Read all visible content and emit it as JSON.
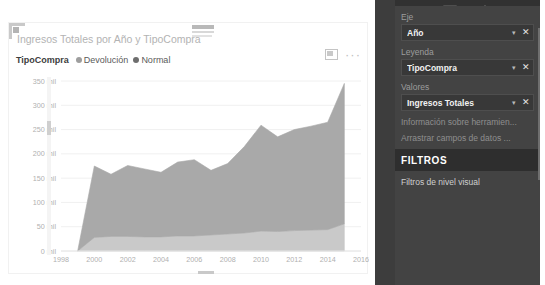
{
  "visual": {
    "title": "Ingresos Totales por Año y TipoCompra",
    "focus_icon": "focus-mode-icon",
    "more_icon": "···"
  },
  "chart_data": {
    "type": "area",
    "title": "Ingresos Totales por Año y TipoCompra",
    "xlabel": "Año",
    "ylabel": "Ingresos Totales",
    "stacked": true,
    "grid": true,
    "legend_position": "top-left",
    "legend_title": "TipoCompra",
    "xlim": [
      1998,
      2016
    ],
    "ylim": [
      0,
      350
    ],
    "y_tick_labels": [
      "350 mil",
      "300 mil",
      "250 mil",
      "200 mil",
      "150 mil",
      "100 mil",
      "50 mil",
      "0 mil"
    ],
    "y_ticks": [
      350,
      300,
      250,
      200,
      150,
      100,
      50,
      0
    ],
    "x_tick_labels": [
      "1998",
      "2000",
      "2002",
      "2004",
      "2006",
      "2008",
      "2010",
      "2012",
      "2014",
      "2016"
    ],
    "x_ticks": [
      1998,
      2000,
      2002,
      2004,
      2006,
      2008,
      2010,
      2012,
      2014,
      2016
    ],
    "x": [
      1999,
      2000,
      2001,
      2002,
      2003,
      2004,
      2005,
      2006,
      2007,
      2008,
      2009,
      2010,
      2011,
      2012,
      2013,
      2014,
      2015
    ],
    "series": [
      {
        "name": "Devolución",
        "color": "#c9c9c9",
        "values": [
          0,
          28,
          30,
          30,
          29,
          29,
          31,
          31,
          33,
          35,
          37,
          41,
          40,
          42,
          43,
          44,
          56
        ]
      },
      {
        "name": "Normal",
        "color": "#a9a9a9",
        "values": [
          0,
          147,
          128,
          146,
          140,
          133,
          152,
          157,
          133,
          145,
          178,
          218,
          195,
          208,
          214,
          221,
          289
        ]
      }
    ],
    "totals": [
      0,
      175,
      158,
      176,
      169,
      162,
      183,
      188,
      166,
      180,
      215,
      259,
      235,
      250,
      257,
      265,
      345
    ]
  },
  "panel": {
    "tabs": [
      {
        "name": "fields-tab",
        "icon": "fields-grid-icon",
        "active": true
      },
      {
        "name": "format-tab",
        "icon": "paint-roller-icon",
        "active": false
      },
      {
        "name": "analytics-tab",
        "icon": "magnifier-chart-icon",
        "active": false
      }
    ],
    "sections": [
      {
        "label": "Eje",
        "chip": "Año"
      },
      {
        "label": "Leyenda",
        "chip": "TipoCompra"
      },
      {
        "label": "Valores",
        "chip": "Ingresos Totales"
      }
    ],
    "tooltip_row": "Información sobre herramien...",
    "drag_row": "Arrastrar campos de datos ...",
    "filters_header": "FILTROS",
    "filters_sub": "Filtros de nivel visual",
    "caret": "▾",
    "close": "✕"
  },
  "colors": {
    "panel_bg": "#434343",
    "panel_tabs_bg": "#313131",
    "filters_bg": "#2e2e2e",
    "series_normal": "#a9a9a9",
    "series_devolucion": "#c9c9c9",
    "grid": "#f0f0f0",
    "title_text": "#b3b3b3"
  }
}
